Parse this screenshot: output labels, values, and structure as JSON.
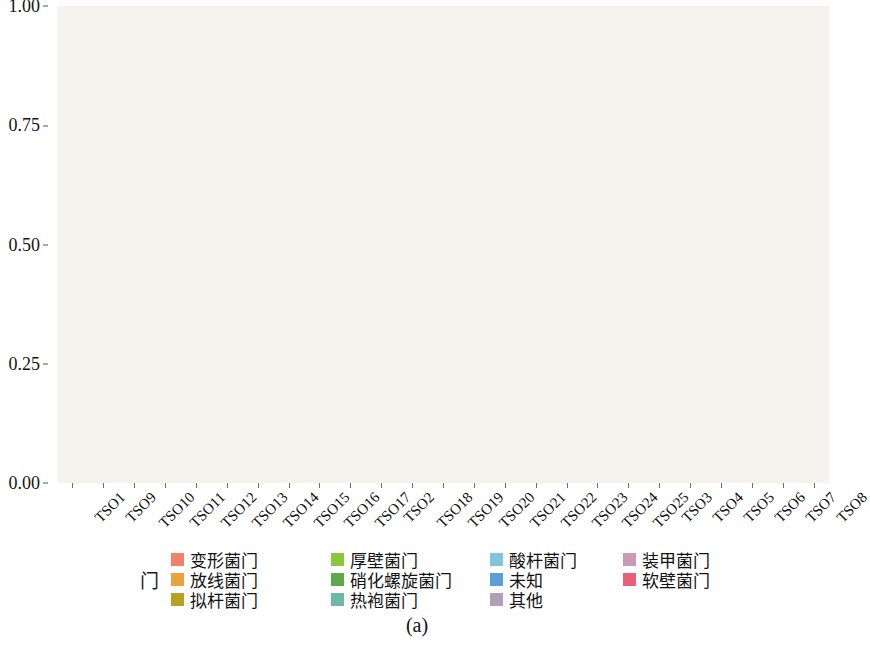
{
  "caption": "(a)",
  "legend_title": "门",
  "axes": {
    "ylabel": "相对丰度",
    "yticks": [
      "0.00",
      "0.25",
      "0.50",
      "0.75",
      "1.00"
    ]
  },
  "chart_data": {
    "type": "bar",
    "subtype": "stacked-bar-100pct",
    "title": "",
    "xlabel": "",
    "ylabel": "相对丰度",
    "ylim": [
      0,
      1
    ],
    "yticks": [
      0.0,
      0.25,
      0.5,
      0.75,
      1.0
    ],
    "grid": false,
    "legend_position": "bottom",
    "legend_title": "门",
    "categories": [
      "TSO1",
      "TSO9",
      "TSO10",
      "TSO11",
      "TSO12",
      "TSO13",
      "TSO14",
      "TSO15",
      "TSO16",
      "TSO17",
      "TSO2",
      "TSO18",
      "TSO19",
      "TSO20",
      "TSO21",
      "TSO22",
      "TSO23",
      "TSO24",
      "TSO25",
      "TSO3",
      "TSO4",
      "TSO5",
      "TSO6",
      "TSO7",
      "TSO8"
    ],
    "series": [
      {
        "name": "变形菌门",
        "color": "#F0816D",
        "values": [
          0.935,
          0.955,
          0.93,
          0.935,
          0.912,
          0.995,
          0.93,
          0.945,
          0.955,
          0.935,
          0.94,
          0.955,
          0.893,
          0.975,
          0.915,
          0.955,
          0.95,
          0.935,
          0.9,
          0.945,
          0.95,
          0.935,
          0.972,
          0.795,
          0.95
        ]
      },
      {
        "name": "放线菌门",
        "color": "#E9A33A",
        "values": [
          0.022,
          0.018,
          0.026,
          0.024,
          0.044,
          0.002,
          0.024,
          0.021,
          0.018,
          0.026,
          0.024,
          0.02,
          0.014,
          0.009,
          0.039,
          0.02,
          0.022,
          0.027,
          0.042,
          0.023,
          0.021,
          0.026,
          0.011,
          0.092,
          0.021
        ]
      },
      {
        "name": "拟杆菌门",
        "color": "#B9A024",
        "values": [
          0.008,
          0.006,
          0.009,
          0.008,
          0.01,
          0.001,
          0.009,
          0.007,
          0.006,
          0.009,
          0.008,
          0.007,
          0.005,
          0.003,
          0.009,
          0.007,
          0.008,
          0.009,
          0.012,
          0.008,
          0.007,
          0.009,
          0.004,
          0.015,
          0.007
        ]
      },
      {
        "name": "厚壁菌门",
        "color": "#8CC63E",
        "values": [
          0.022,
          0.013,
          0.022,
          0.021,
          0.022,
          0.001,
          0.024,
          0.016,
          0.013,
          0.02,
          0.018,
          0.012,
          0.012,
          0.008,
          0.024,
          0.011,
          0.014,
          0.019,
          0.032,
          0.016,
          0.014,
          0.019,
          0.008,
          0.065,
          0.014
        ]
      },
      {
        "name": "硝化螺旋菌门",
        "color": "#5FA84E",
        "values": [
          0.006,
          0.004,
          0.007,
          0.006,
          0.006,
          0.0,
          0.007,
          0.005,
          0.004,
          0.006,
          0.005,
          0.004,
          0.004,
          0.002,
          0.007,
          0.003,
          0.004,
          0.005,
          0.009,
          0.005,
          0.004,
          0.006,
          0.002,
          0.018,
          0.004
        ]
      },
      {
        "name": "热袍菌门",
        "color": "#6BB9A8",
        "values": [
          0.004,
          0.002,
          0.004,
          0.003,
          0.004,
          0.0,
          0.004,
          0.003,
          0.002,
          0.003,
          0.003,
          0.002,
          0.003,
          0.001,
          0.004,
          0.002,
          0.002,
          0.003,
          0.004,
          0.003,
          0.002,
          0.003,
          0.001,
          0.005,
          0.002
        ]
      },
      {
        "name": "酸杆菌门",
        "color": "#7FC5DC",
        "values": [
          0.001,
          0.001,
          0.001,
          0.001,
          0.001,
          0.0,
          0.001,
          0.001,
          0.001,
          0.0,
          0.001,
          0.0,
          0.065,
          0.001,
          0.001,
          0.001,
          0.0,
          0.001,
          0.001,
          0.0,
          0.001,
          0.001,
          0.001,
          0.002,
          0.001
        ]
      },
      {
        "name": "未知",
        "color": "#5C9FD8",
        "values": [
          0.001,
          0.0,
          0.0,
          0.001,
          0.0,
          0.0,
          0.0,
          0.001,
          0.0,
          0.0,
          0.0,
          0.0,
          0.003,
          0.0,
          0.0,
          0.0,
          0.0,
          0.0,
          0.0,
          0.0,
          0.0,
          0.0,
          0.0,
          0.001,
          0.0
        ]
      },
      {
        "name": "其他",
        "color": "#AFA0B8",
        "values": [
          0.001,
          0.001,
          0.001,
          0.001,
          0.001,
          0.001,
          0.001,
          0.001,
          0.001,
          0.001,
          0.001,
          0.0,
          0.001,
          0.001,
          0.001,
          0.001,
          0.0,
          0.001,
          0.0,
          0.0,
          0.001,
          0.001,
          0.001,
          0.002,
          0.001
        ]
      },
      {
        "name": "装甲菌门",
        "color": "#C89AB8",
        "values": [
          0.0,
          0.0,
          0.0,
          0.0,
          0.0,
          0.0,
          0.0,
          0.0,
          0.0,
          0.0,
          0.0,
          0.0,
          0.0,
          0.0,
          0.0,
          0.0,
          0.0,
          0.0,
          0.0,
          0.0,
          0.0,
          0.0,
          0.0,
          0.001,
          0.0
        ]
      },
      {
        "name": "软壁菌门",
        "color": "#E8607A",
        "values": [
          0.0,
          0.0,
          0.0,
          0.0,
          0.0,
          0.0,
          0.0,
          0.0,
          0.0,
          0.0,
          0.0,
          0.0,
          0.0,
          0.0,
          0.0,
          0.0,
          0.0,
          0.0,
          0.0,
          0.0,
          0.0,
          0.0,
          0.0,
          0.004,
          0.0
        ]
      }
    ]
  },
  "legend_columns": [
    {
      "items": [
        {
          "label": "变形菌门",
          "color": "#F0816D"
        },
        {
          "label": "放线菌门",
          "color": "#E9A33A"
        },
        {
          "label": "拟杆菌门",
          "color": "#B9A024"
        }
      ]
    },
    {
      "items": [
        {
          "label": "厚壁菌门",
          "color": "#8CC63E"
        },
        {
          "label": "硝化螺旋菌门",
          "color": "#5FA84E"
        },
        {
          "label": "热袍菌门",
          "color": "#6BB9A8"
        }
      ]
    },
    {
      "items": [
        {
          "label": "酸杆菌门",
          "color": "#7FC5DC"
        },
        {
          "label": "未知",
          "color": "#5C9FD8"
        },
        {
          "label": "其他",
          "color": "#AFA0B8"
        }
      ]
    },
    {
      "items": [
        {
          "label": "装甲菌门",
          "color": "#C89AB8"
        },
        {
          "label": "软壁菌门",
          "color": "#E8607A"
        }
      ]
    }
  ]
}
